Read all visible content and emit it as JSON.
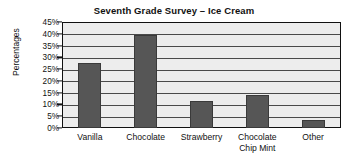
{
  "chart_data": {
    "type": "bar",
    "title": "Seventh Grade Survey – Ice Cream",
    "xlabel": "",
    "ylabel": "Percentages",
    "categories": [
      "Vanilla",
      "Chocolate",
      "Strawberry",
      "Chocolate\nChip Mint",
      "Other"
    ],
    "values": [
      27.5,
      39.5,
      11.5,
      14.0,
      3.5
    ],
    "ylim": [
      0,
      45
    ],
    "ytick_labels": [
      "45%",
      "40%",
      "35%",
      "30%",
      "25%",
      "20%",
      "15%",
      "10%",
      "5%",
      "0%"
    ],
    "ytick_values": [
      45,
      40,
      35,
      30,
      25,
      20,
      15,
      10,
      5,
      0
    ],
    "grid": true,
    "legend": false,
    "bar_color": "#565656",
    "plot_background": "#ededed",
    "axis_color": "#111111"
  }
}
